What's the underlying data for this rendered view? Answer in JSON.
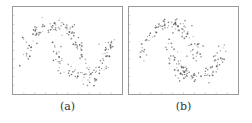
{
  "figure": {
    "panels": [
      {
        "id": "a",
        "caption": "(a)"
      },
      {
        "id": "b",
        "caption": "(b)"
      }
    ]
  },
  "chart_data": [
    {
      "type": "scatter",
      "title": "(a)",
      "xlabel": "",
      "ylabel": "",
      "grid": false,
      "description": "Two interleaving half-moons dataset",
      "xlim": [
        -1.5,
        2.5
      ],
      "ylim": [
        -1.0,
        1.5
      ],
      "series": [
        {
          "name": "upper moon",
          "shape": "arc",
          "center": [
            0,
            0
          ],
          "radius": 1,
          "angle_range_deg": [
            0,
            180
          ]
        },
        {
          "name": "lower moon",
          "shape": "arc",
          "center": [
            1,
            0.5
          ],
          "radius": 1,
          "angle_range_deg": [
            180,
            360
          ]
        }
      ],
      "n_points_approx": 200,
      "noise": 0.12,
      "point_color": "#555555"
    },
    {
      "type": "scatter",
      "title": "(b)",
      "xlabel": "",
      "ylabel": "",
      "grid": false,
      "description": "Two interleaving half-moons dataset",
      "xlim": [
        -1.5,
        2.5
      ],
      "ylim": [
        -1.0,
        1.5
      ],
      "series": [
        {
          "name": "upper moon",
          "shape": "arc",
          "center": [
            0,
            0
          ],
          "radius": 1,
          "angle_range_deg": [
            0,
            180
          ]
        },
        {
          "name": "lower moon",
          "shape": "arc",
          "center": [
            1,
            0.5
          ],
          "radius": 1,
          "angle_range_deg": [
            180,
            360
          ]
        }
      ],
      "n_points_approx": 200,
      "noise": 0.12,
      "point_color": "#555555"
    }
  ]
}
